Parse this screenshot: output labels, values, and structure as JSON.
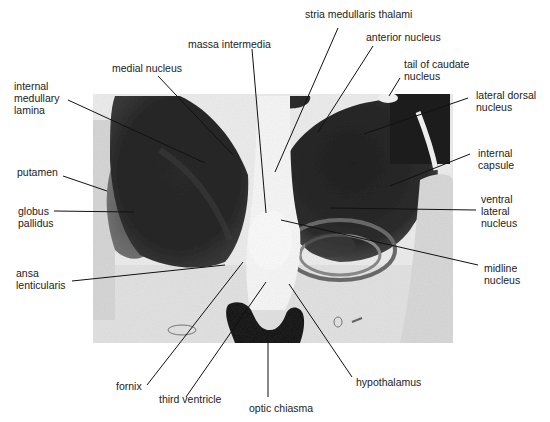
{
  "figure": {
    "type": "labeled-brain-section",
    "photo": {
      "x": 93,
      "y": 94,
      "width": 360,
      "height": 249
    },
    "colors": {
      "background": "#ffffff",
      "tissue_dark": "#1e1e1e",
      "tissue_mid": "#4a4a4a",
      "tissue_light": "#e8e8e8",
      "line": "#111111"
    }
  },
  "labels": {
    "massa_intermedia": {
      "lines": [
        "massa intermedia"
      ]
    },
    "stria_medullaris_thalami": {
      "lines": [
        "stria medullaris thalami"
      ]
    },
    "anterior_nucleus": {
      "lines": [
        "anterior nucleus"
      ]
    },
    "medial_nucleus": {
      "lines": [
        "medial nucleus"
      ]
    },
    "tail_of_caudate_nucleus": {
      "lines": [
        "tail of caudate",
        "nucleus"
      ]
    },
    "internal_medullary_lamina": {
      "lines": [
        "internal",
        "medullary",
        "lamina"
      ]
    },
    "lateral_dorsal_nucleus": {
      "lines": [
        "lateral dorsal",
        "nucleus"
      ]
    },
    "internal_capsule": {
      "lines": [
        "internal",
        "capsule"
      ]
    },
    "putamen": {
      "lines": [
        "putamen"
      ]
    },
    "globus_pallidus": {
      "lines": [
        "globus",
        "pallidus"
      ]
    },
    "ventral_lateral_nucleus": {
      "lines": [
        "ventral",
        "lateral",
        "nucleus"
      ]
    },
    "ansa_lenticularis": {
      "lines": [
        "ansa",
        "lenticularis"
      ]
    },
    "midline_nucleus": {
      "lines": [
        "midline",
        "nucleus"
      ]
    },
    "fornix": {
      "lines": [
        "fornix"
      ]
    },
    "hypothalamus": {
      "lines": [
        "hypothalamus"
      ]
    },
    "third_ventricle": {
      "lines": [
        "third ventricle"
      ]
    },
    "optic_chiasma": {
      "lines": [
        "optic chiasma"
      ]
    }
  }
}
